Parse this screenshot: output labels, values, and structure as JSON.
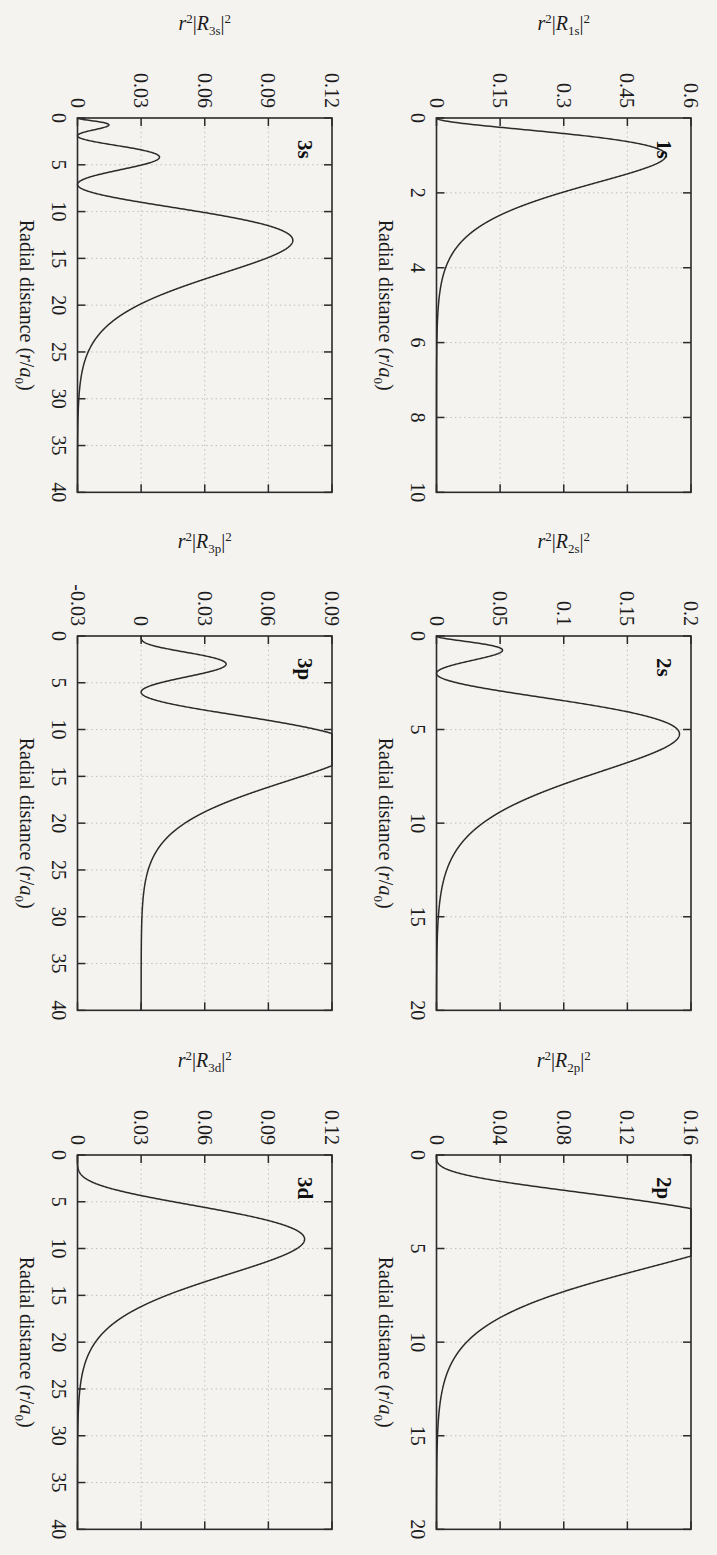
{
  "figure": {
    "rotation_deg": 90,
    "background_color": "#f4f3f0",
    "ink_color": "#2b2b2b",
    "grid_color": "#b8b6b2",
    "rows": 2,
    "cols": 3,
    "shared_xlabel": "Radial distance (r/a0)"
  },
  "chart_data": [
    {
      "type": "line",
      "title": "1s",
      "xlabel": "Radial distance (r/a₀)",
      "ylabel": "r²|R₁ₛ|²",
      "ylabel_parts": {
        "pre": "r",
        "pre_sup": "2",
        "mid": "|R",
        "sub": "1s",
        "post": "|",
        "post_sup": "2"
      },
      "xlim": [
        0,
        10
      ],
      "ylim": [
        0,
        0.6
      ],
      "xticks": [
        0,
        2,
        4,
        6,
        8,
        10
      ],
      "xticklabels": [
        "0",
        "2",
        "4",
        "6",
        "8",
        "10"
      ],
      "yticks": [
        0,
        0.15,
        0.3,
        0.45,
        0.6
      ],
      "yticklabels": [
        "0",
        "0.15",
        "0.3",
        "0.45",
        "0.6"
      ],
      "grid": true,
      "n": 1,
      "l": 0,
      "peak_x": 1.0,
      "peak_y": 0.5413,
      "nodes": [],
      "x": [
        0,
        0.25,
        0.5,
        0.75,
        1,
        1.25,
        1.5,
        1.75,
        2,
        2.5,
        3,
        3.5,
        4,
        4.5,
        5,
        5.5,
        6,
        7,
        8,
        9,
        10
      ],
      "y": [
        0,
        0.0947,
        0.3679,
        0.5021,
        0.5413,
        0.5133,
        0.4481,
        0.3694,
        0.2931,
        0.1684,
        0.0892,
        0.0446,
        0.0215,
        0.01,
        0.0045,
        0.002,
        0.0009,
        0.0002,
        4e-05,
        7e-06,
        1e-06
      ]
    },
    {
      "type": "line",
      "title": "2s",
      "xlabel": "Radial distance (r/a₀)",
      "ylabel": "r²|R₂ₛ|²",
      "ylabel_parts": {
        "pre": "r",
        "pre_sup": "2",
        "mid": "|R",
        "sub": "2s",
        "post": "|",
        "post_sup": "2"
      },
      "xlim": [
        0,
        20
      ],
      "ylim": [
        0,
        0.2
      ],
      "xticks": [
        0,
        5,
        10,
        15,
        20
      ],
      "xticklabels": [
        "0",
        "5",
        "10",
        "15",
        "20"
      ],
      "yticks": [
        0,
        0.05,
        0.1,
        0.15,
        0.2
      ],
      "yticklabels": [
        "0",
        "0.05",
        "0.1",
        "0.15",
        "0.2"
      ],
      "grid": true,
      "n": 2,
      "l": 0,
      "peak_x": 5.24,
      "peak_y": 0.191,
      "secondary_peak_x": 0.76,
      "secondary_peak_y": 0.0527,
      "nodes": [
        2.0
      ]
    },
    {
      "type": "line",
      "title": "2p",
      "xlabel": "Radial distance (r/a₀)",
      "ylabel": "r²|R₂ₚ|²",
      "ylabel_parts": {
        "pre": "r",
        "pre_sup": "2",
        "mid": "|R",
        "sub": "2p",
        "post": "|",
        "post_sup": "2"
      },
      "xlim": [
        0,
        20
      ],
      "ylim": [
        0,
        0.16
      ],
      "xticks": [
        0,
        5,
        10,
        15,
        20
      ],
      "xticklabels": [
        "0",
        "5",
        "10",
        "15",
        "20"
      ],
      "yticks": [
        0,
        0.04,
        0.08,
        0.12,
        0.16
      ],
      "yticklabels": [
        "0",
        "0.04",
        "0.08",
        "0.12",
        "0.16"
      ],
      "grid": true,
      "n": 2,
      "l": 1,
      "peak_x": 4.0,
      "peak_y": 0.1465,
      "nodes": []
    },
    {
      "type": "line",
      "title": "3s",
      "xlabel": "Radial distance (r/a₀)",
      "ylabel": "r²|R₃ₛ|²",
      "ylabel_parts": {
        "pre": "r",
        "pre_sup": "2",
        "mid": "|R",
        "sub": "3s",
        "post": "|",
        "post_sup": "2"
      },
      "xlim": [
        0,
        40
      ],
      "ylim": [
        0,
        0.12
      ],
      "xticks": [
        0,
        5,
        10,
        15,
        20,
        25,
        30,
        35,
        40
      ],
      "xticklabels": [
        "0",
        "5",
        "10",
        "15",
        "20",
        "25",
        "30",
        "35",
        "40"
      ],
      "yticks": [
        0,
        0.03,
        0.06,
        0.09,
        0.12
      ],
      "yticklabels": [
        "0",
        "0.03",
        "0.06",
        "0.09",
        "0.12"
      ],
      "grid": true,
      "n": 3,
      "l": 0,
      "peak_x": 13.1,
      "peak_y": 0.1005,
      "nodes": [
        1.9,
        7.1
      ]
    },
    {
      "type": "line",
      "title": "3p",
      "xlabel": "Radial distance (r/a₀)",
      "ylabel": "r²|R₃ₚ|²",
      "ylabel_parts": {
        "pre": "r",
        "pre_sup": "2",
        "mid": "|R",
        "sub": "3p",
        "post": "|",
        "post_sup": "2"
      },
      "xlim": [
        0,
        40
      ],
      "ylim": [
        -0.03,
        0.09
      ],
      "xticks": [
        0,
        5,
        10,
        15,
        20,
        25,
        30,
        35,
        40
      ],
      "xticklabels": [
        "0",
        "5",
        "10",
        "15",
        "20",
        "25",
        "30",
        "35",
        "40"
      ],
      "yticks": [
        -0.03,
        0,
        0.03,
        0.06,
        0.09
      ],
      "yticklabels": [
        "-0.03",
        "0",
        "0.03",
        "0.06",
        "0.09"
      ],
      "grid": true,
      "n": 3,
      "l": 1,
      "peak_x": 12.0,
      "peak_y": 0.077,
      "secondary_peak_x": 3.1,
      "secondary_peak_y": 0.017,
      "nodes": [
        6.0
      ]
    },
    {
      "type": "line",
      "title": "3d",
      "xlabel": "Radial distance (r/a₀)",
      "ylabel": "r²|R₃ₔ|²",
      "ylabel_parts": {
        "pre": "r",
        "pre_sup": "2",
        "mid": "|R",
        "sub": "3d",
        "post": "|",
        "post_sup": "2"
      },
      "xlim": [
        0,
        40
      ],
      "ylim": [
        0,
        0.12
      ],
      "xticks": [
        0,
        5,
        10,
        15,
        20,
        25,
        30,
        35,
        40
      ],
      "xticklabels": [
        "0",
        "5",
        "10",
        "15",
        "20",
        "25",
        "30",
        "35",
        "40"
      ],
      "yticks": [
        0,
        0.03,
        0.06,
        0.09,
        0.12
      ],
      "yticklabels": [
        "0",
        "0.03",
        "0.06",
        "0.09",
        "0.12"
      ],
      "grid": true,
      "n": 3,
      "l": 2,
      "peak_x": 9.0,
      "peak_y": 0.107,
      "nodes": []
    }
  ]
}
